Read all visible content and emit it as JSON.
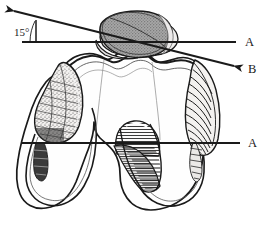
{
  "figure": {
    "background_color": "#ffffff",
    "ink_color": "#1a1a1a",
    "patella_fill_color": "#9a9a9a",
    "bone_fill_color": "#fdfdfd"
  },
  "annotations": {
    "angle_label": "15°",
    "angle_value_degrees": 15,
    "line_a_upper_label": "A",
    "line_b_label": "B",
    "line_a_lower_label": "A"
  },
  "lines": {
    "line_a_upper": {
      "label": "A",
      "type": "reference-horizontal",
      "x1": 22,
      "y1": 42,
      "x2": 236,
      "y2": 42,
      "arrowhead": "none"
    },
    "line_b": {
      "label": "B",
      "type": "angled-axis",
      "x1": 12,
      "y1": 10,
      "x2": 236,
      "y2": 66,
      "arrowhead": "both"
    },
    "line_a_lower": {
      "label": "A",
      "type": "reference-horizontal",
      "x1": 22,
      "y1": 143,
      "x2": 240,
      "y2": 143,
      "arrowhead": "none"
    }
  },
  "structures": {
    "patella": {
      "name": "patella",
      "shading": "stippled-gray"
    },
    "trochlea": {
      "name": "femoral-trochlea",
      "shading": "outline"
    },
    "medial_condyle": {
      "name": "medial-femoral-condyle",
      "shading": "outline"
    },
    "lateral_condyle": {
      "name": "lateral-femoral-condyle",
      "shading": "outline"
    },
    "left_osteophyte": {
      "name": "left-bony-prominence",
      "shading": "stipple-hatch"
    },
    "right_osteophyte": {
      "name": "right-bony-prominence",
      "shading": "line-hatch"
    },
    "intercondylar_notch": {
      "name": "intercondylar-notch",
      "shading": "dense-horizontal-hatch"
    }
  }
}
